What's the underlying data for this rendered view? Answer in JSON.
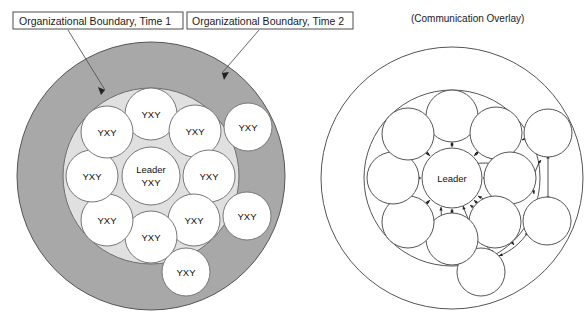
{
  "figure": {
    "type": "diagram"
  },
  "labels": {
    "boundary_time1": "Organizational Boundary, Time 1",
    "boundary_time2": "Organizational Boundary, Time 2",
    "overlay_title": "(Communication Overlay)"
  },
  "colors": {
    "outer_ring_fill": "#a8a8a8",
    "inner_disc_fill": "#e0e0e0",
    "node_fill": "#ffffff",
    "stroke": "#4d4d4d",
    "overlay_stroke": "#333333",
    "text": "#111111"
  },
  "left_panel": {
    "leader_label_line1": "Leader",
    "leader_label_line2": "YXY",
    "member_label": "YXY",
    "inner_members": [
      {
        "id": "n1",
        "label": "YXY"
      },
      {
        "id": "n2",
        "label": "YXY"
      },
      {
        "id": "n3",
        "label": "YXY"
      },
      {
        "id": "n4",
        "label": "YXY"
      },
      {
        "id": "n5",
        "label": "YXY"
      },
      {
        "id": "n6",
        "label": "YXY"
      },
      {
        "id": "n7",
        "label": "YXY"
      },
      {
        "id": "n8",
        "label": "YXY"
      }
    ],
    "outer_members": [
      {
        "id": "o1",
        "label": "YXY"
      },
      {
        "id": "o2",
        "label": "YXY"
      },
      {
        "id": "o3",
        "label": "YXY"
      }
    ],
    "inner_member_count": 8,
    "outer_member_count": 3
  },
  "right_panel": {
    "leader_label": "Leader",
    "inner_member_count": 8,
    "outer_member_count": 3,
    "connection_style": "bidirectional-arrows"
  }
}
